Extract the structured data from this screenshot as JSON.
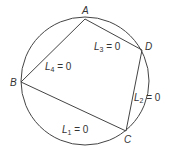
{
  "diagram": {
    "circle": {
      "cx": 85,
      "cy": 81,
      "r": 64,
      "stroke": "#444444"
    },
    "vertices": [
      {
        "name": "A",
        "x": 85,
        "y": 19,
        "label_x": 82,
        "label_y": 14
      },
      {
        "name": "B",
        "x": 21,
        "y": 82,
        "label_x": 10,
        "label_y": 86
      },
      {
        "name": "C",
        "x": 126,
        "y": 131,
        "label_x": 124,
        "label_y": 143
      },
      {
        "name": "D",
        "x": 142,
        "y": 50,
        "label_x": 145,
        "label_y": 50
      }
    ],
    "sides": [
      {
        "name": "L1",
        "from": "B",
        "to": "C",
        "label_main": "L",
        "label_sub": "1",
        "label_rest": " = 0",
        "x": 62,
        "y": 133
      },
      {
        "name": "L2",
        "from": "C",
        "to": "D",
        "label_main": "L",
        "label_sub": "2",
        "label_rest": " = 0",
        "x": 134,
        "y": 101
      },
      {
        "name": "L3",
        "from": "A",
        "to": "D",
        "label_main": "L",
        "label_sub": "3",
        "label_rest": " = 0",
        "x": 94,
        "y": 50
      },
      {
        "name": "L4",
        "from": "A",
        "to": "B",
        "label_main": "L",
        "label_sub": "4",
        "label_rest": " = 0",
        "x": 45,
        "y": 70
      }
    ]
  }
}
